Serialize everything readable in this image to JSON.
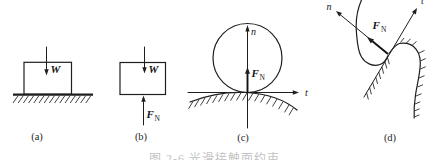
{
  "figure": {
    "background": "#ffffff",
    "ink_color": "#1f1f1f",
    "caption_clipped": "图 2-6 光滑接触面约束",
    "panels": {
      "a": {
        "label": "(a)",
        "forces": {
          "weight": "W"
        }
      },
      "b": {
        "label": "(b)",
        "forces": {
          "weight": "W",
          "normal_main": "F",
          "normal_sub": "N"
        }
      },
      "c": {
        "label": "(c)",
        "axes": {
          "normal": "n",
          "tangent": "t"
        },
        "forces": {
          "normal_main": "F",
          "normal_sub": "N"
        }
      },
      "d": {
        "label": "(d)",
        "axes": {
          "normal": "n",
          "tangent": "t"
        },
        "forces": {
          "normal_main": "F",
          "normal_sub": "N"
        }
      }
    }
  }
}
